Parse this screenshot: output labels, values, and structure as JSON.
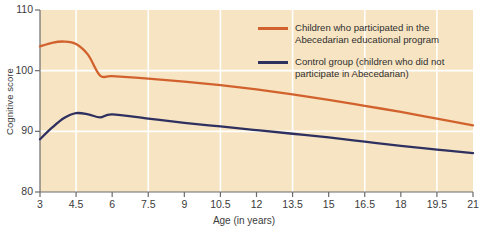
{
  "chart_data": {
    "type": "line",
    "title": "",
    "xlabel": "Age (in years)",
    "ylabel": "Cognitive score",
    "xlim": [
      3,
      21
    ],
    "ylim": [
      80,
      110
    ],
    "xticks": [
      "3",
      "4.5",
      "6",
      "7.5",
      "9",
      "10.5",
      "12",
      "13.5",
      "15",
      "16.5",
      "18",
      "19.5",
      "21"
    ],
    "yticks": [
      "80",
      "90",
      "100",
      "110"
    ],
    "grid": "white gridlines, vertical every 3 years, horizontal at 90 and 100",
    "plot_background": "#f7e4c3",
    "legend_position": "top-right inside plot",
    "series": [
      {
        "name": "Children who participated in the\nAbecedarian educational program",
        "color": "#d2622d",
        "x": [
          3,
          3.5,
          4,
          4.5,
          5,
          5.5,
          6,
          7.5,
          9,
          10.5,
          12,
          13.5,
          15,
          16.5,
          18,
          19.5,
          21
        ],
        "values": [
          104.0,
          104.6,
          104.8,
          104.4,
          102.6,
          99.2,
          99.1,
          98.7,
          98.2,
          97.6,
          96.9,
          96.1,
          95.2,
          94.2,
          93.2,
          92.1,
          91.0
        ]
      },
      {
        "name": "Control group (children who did not\nparticipate in Abecedarian)",
        "color": "#2e3060",
        "x": [
          3,
          3.5,
          4,
          4.5,
          5,
          5.5,
          6,
          7.5,
          9,
          10.5,
          12,
          13.5,
          15,
          16.5,
          18,
          19.5,
          21
        ],
        "values": [
          88.7,
          90.6,
          92.2,
          93.0,
          92.8,
          92.3,
          92.8,
          92.1,
          91.4,
          90.8,
          90.2,
          89.6,
          89.0,
          88.3,
          87.6,
          87.0,
          86.4
        ]
      }
    ]
  },
  "legend": [
    {
      "label": "Children who participated in the\nAbecedarian educational program",
      "color": "#d2622d"
    },
    {
      "label": "Control group (children who did not\nparticipate in Abecedarian)",
      "color": "#2e3060"
    }
  ]
}
